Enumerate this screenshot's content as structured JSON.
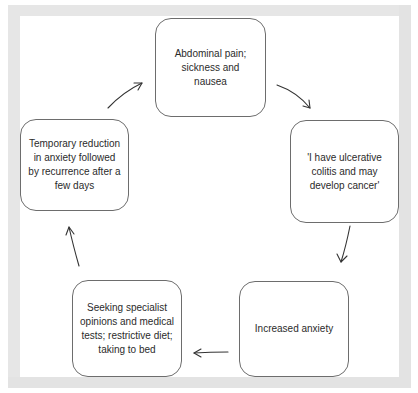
{
  "diagram": {
    "type": "cycle",
    "colors": {
      "frame": "#e6e6e6",
      "node_border": "#6d6d6d",
      "node_fill": "#ffffff",
      "text": "#2b2b2b",
      "arrow": "#333333"
    },
    "nodes": [
      {
        "id": "n1",
        "label": "Abdominal pain; sickness and nausea"
      },
      {
        "id": "n2",
        "label": "'I have ulcerative colitis and may develop cancer'"
      },
      {
        "id": "n3",
        "label": "Increased anxiety"
      },
      {
        "id": "n4",
        "label": "Seeking specialist opinions and medical tests; restrictive diet; taking to bed"
      },
      {
        "id": "n5",
        "label": "Temporary reduction in anxiety followed by recurrence after a few days"
      }
    ],
    "edges": [
      {
        "from": "n1",
        "to": "n2"
      },
      {
        "from": "n2",
        "to": "n3"
      },
      {
        "from": "n3",
        "to": "n4"
      },
      {
        "from": "n4",
        "to": "n5"
      },
      {
        "from": "n5",
        "to": "n1"
      }
    ]
  }
}
